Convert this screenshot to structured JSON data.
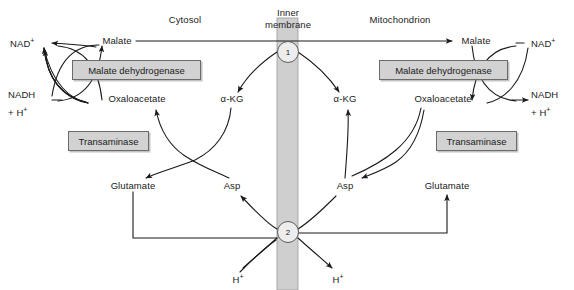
{
  "figure": {
    "regions": {
      "cytosol": "Cytosol",
      "membrane_line1": "Inner",
      "membrane_line2": "membrane",
      "mitochondrion": "Mitochondrion"
    },
    "colors": {
      "membrane_band": "#cfcfcf",
      "enzyme_box_fill": "#d2d2d2",
      "enzyme_box_border": "#6b6b6b",
      "transporter_fill": "#ededed",
      "line": "#1a1a1a",
      "text": "#1a1a1a",
      "background": "#ffffff"
    }
  },
  "cytosol": {
    "nad_plus": "NAD",
    "nad_plus_sup": "+",
    "nadh": "NADH",
    "nadh_second_line": "+ H",
    "nadh_second_line_sup": "+",
    "malate": "Malate",
    "oxaloacetate": "Oxaloacetate",
    "alpha_kg": "α-KG",
    "glutamate": "Glutamate",
    "asp": "Asp",
    "enzyme_malate_dehydrogenase": "Malate dehydrogenase",
    "enzyme_transaminase": "Transaminase",
    "proton": "H",
    "proton_sup": "+"
  },
  "mitochondrion": {
    "nad_plus": "NAD",
    "nad_plus_sup": "+",
    "nadh": "NADH",
    "nadh_second_line": "+ H",
    "nadh_second_line_sup": "+",
    "malate": "Malate",
    "oxaloacetate": "Oxaloacetate",
    "alpha_kg": "α-KG",
    "glutamate": "Glutamate",
    "asp": "Asp",
    "enzyme_malate_dehydrogenase": "Malate dehydrogenase",
    "enzyme_transaminase": "Transaminase",
    "proton": "H",
    "proton_sup": "+"
  },
  "transporters": [
    {
      "id": "1",
      "name": "malate-alpha-ketoglutarate-carrier"
    },
    {
      "id": "2",
      "name": "glutamate-aspartate-carrier"
    }
  ]
}
